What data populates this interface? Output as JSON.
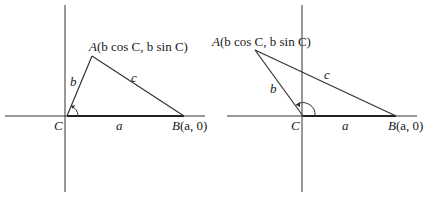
{
  "figures": [
    {
      "id": "acute",
      "vertex_A_label": "A",
      "vertex_A_coords": "(b cos C, b sin C)",
      "vertex_B_label": "B",
      "vertex_B_coords": "(a, 0)",
      "vertex_C_label": "C",
      "side_a": "a",
      "side_b": "b",
      "side_c": "c",
      "angle": "C"
    },
    {
      "id": "obtuse",
      "vertex_A_label": "A",
      "vertex_A_coords": "(b cos C, b sin C)",
      "vertex_B_label": "B",
      "vertex_B_coords": "(a, 0)",
      "vertex_C_label": "C",
      "side_a": "a",
      "side_b": "b",
      "side_c": "c",
      "angle": "C"
    }
  ],
  "colors": {
    "line": "#333333",
    "text": "#1a1a1a",
    "background": "#ffffff"
  }
}
